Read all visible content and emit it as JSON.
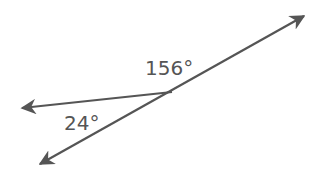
{
  "diagram": {
    "type": "angle-diagram",
    "line_color": "#555555",
    "label_color": "#555555",
    "vertex": [
      172,
      92
    ],
    "rays": [
      {
        "name": "ray-upper-right",
        "end": [
          304,
          16
        ]
      },
      {
        "name": "ray-left",
        "end": [
          22,
          108
        ]
      },
      {
        "name": "ray-lower-left",
        "end": [
          40,
          164
        ]
      }
    ],
    "angles": [
      {
        "label": "156°",
        "between": [
          "ray-upper-right",
          "ray-left"
        ]
      },
      {
        "label": "24°",
        "between": [
          "ray-left",
          "ray-lower-left"
        ]
      }
    ]
  }
}
